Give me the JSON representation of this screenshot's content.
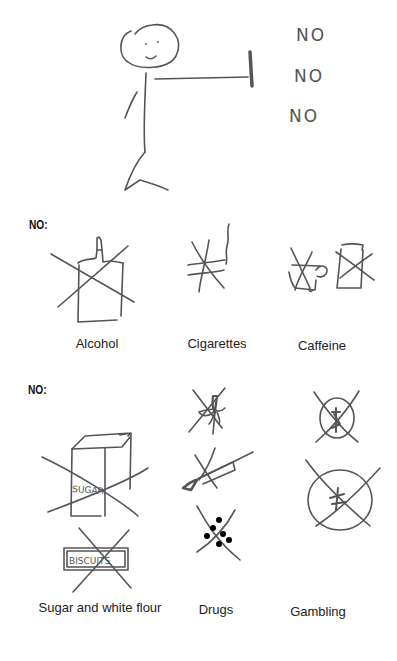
{
  "header": {
    "figure": "stick-figure-stop-gesture",
    "shouts": [
      "NO",
      "NO",
      "NO"
    ]
  },
  "section1": {
    "label": "NO:",
    "items": [
      {
        "caption": "Alcohol",
        "icon": "crossed-out-bottle"
      },
      {
        "caption": "Cigarettes",
        "icon": "crossed-out-cigarette"
      },
      {
        "caption": "Caffeine",
        "icon": "crossed-out-cups"
      }
    ]
  },
  "section2": {
    "label": "NO:",
    "items": [
      {
        "caption": "Sugar and white flour",
        "icon": "crossed-out-sugar-and-biscuits",
        "sketch_text": [
          "SUGAR",
          "BISCUITS"
        ]
      },
      {
        "caption": "Drugs",
        "icon": "crossed-out-leaf-syringe-pills"
      },
      {
        "caption": "Gambling",
        "icon": "crossed-out-coins"
      }
    ]
  }
}
